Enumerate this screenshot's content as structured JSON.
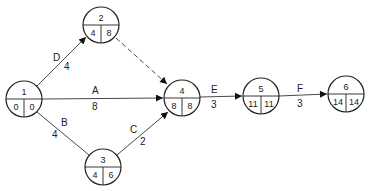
{
  "diagram": {
    "type": "activity-on-arrow network",
    "nodes": [
      {
        "id": "1",
        "label": "1",
        "early": "0",
        "late": "0",
        "cx": 24,
        "cy": 99
      },
      {
        "id": "2",
        "label": "2",
        "early": "4",
        "late": "8",
        "cx": 101,
        "cy": 25
      },
      {
        "id": "3",
        "label": "3",
        "early": "4",
        "late": "6",
        "cx": 103,
        "cy": 167
      },
      {
        "id": "4",
        "label": "4",
        "early": "8",
        "late": "8",
        "cx": 182,
        "cy": 98
      },
      {
        "id": "5",
        "label": "5",
        "early": "11",
        "late": "11",
        "cx": 261,
        "cy": 96
      },
      {
        "id": "6",
        "label": "6",
        "early": "14",
        "late": "14",
        "cx": 346,
        "cy": 94
      }
    ],
    "edges": [
      {
        "from": "1",
        "to": "2",
        "activity": "D",
        "duration": "4",
        "dashed": false
      },
      {
        "from": "1",
        "to": "4",
        "activity": "A",
        "duration": "8",
        "dashed": false
      },
      {
        "from": "1",
        "to": "3",
        "activity": "B",
        "duration": "4",
        "dashed": false
      },
      {
        "from": "3",
        "to": "4",
        "activity": "C",
        "duration": "2",
        "dashed": false
      },
      {
        "from": "2",
        "to": "4",
        "activity": "",
        "duration": "",
        "dashed": true
      },
      {
        "from": "4",
        "to": "5",
        "activity": "E",
        "duration": "3",
        "dashed": false
      },
      {
        "from": "5",
        "to": "6",
        "activity": "F",
        "duration": "3",
        "dashed": false
      }
    ]
  }
}
